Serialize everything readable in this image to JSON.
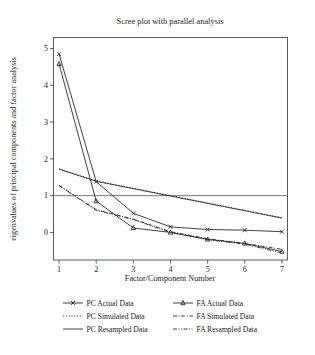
{
  "figure": {
    "title": "Scree plot with parallel analysis",
    "background_color": "#ffffff",
    "line_color": "#2b2b2b",
    "frame_color": "#333333",
    "reference_line_color": "#555555"
  },
  "axes": {
    "x_label": "Factor/Component Number",
    "y_label": "eigenvalues of principal components and factor analysis",
    "x_ticks": [
      "1",
      "2",
      "3",
      "4",
      "5",
      "6",
      "7"
    ],
    "y_ticks": [
      "0",
      "1",
      "2",
      "3",
      "4",
      "5"
    ]
  },
  "legend": {
    "entries": [
      {
        "label": "PC Actual Data",
        "style": "solid-marker-x",
        "column": 0,
        "row": 0
      },
      {
        "label": "PC Simulated Data",
        "style": "dotted",
        "column": 0,
        "row": 1
      },
      {
        "label": "PC Resampled Data",
        "style": "solid",
        "column": 0,
        "row": 2
      },
      {
        "label": "FA Actual Data",
        "style": "solid-marker-triangle",
        "column": 1,
        "row": 0
      },
      {
        "label": "FA Simulated Data",
        "style": "dash-dot",
        "column": 1,
        "row": 1
      },
      {
        "label": "FA Resampled Data",
        "style": "dash-dot-dot",
        "column": 1,
        "row": 2
      }
    ]
  },
  "chart_data": {
    "type": "line",
    "title": "Scree plot with parallel analysis",
    "xlabel": "Factor/Component Number",
    "ylabel": "eigenvalues of principal components and factor analysis",
    "x": [
      1,
      2,
      3,
      4,
      5,
      6,
      7
    ],
    "xlim": [
      0.85,
      7.15
    ],
    "ylim": [
      -0.75,
      5.3
    ],
    "grid": false,
    "legend_position": "below-plot",
    "reference_line_y": 1,
    "series": [
      {
        "name": "PC Actual Data",
        "marker": "x",
        "linestyle": "solid",
        "values": [
          4.85,
          1.38,
          0.52,
          0.15,
          0.08,
          0.06,
          0.02
        ]
      },
      {
        "name": "FA Actual Data",
        "marker": "triangle",
        "linestyle": "solid",
        "values": [
          4.58,
          0.85,
          0.12,
          0.0,
          -0.19,
          -0.3,
          -0.52
        ]
      },
      {
        "name": "PC Simulated Data",
        "marker": "none",
        "linestyle": "dotted",
        "values": [
          1.73,
          1.4,
          1.2,
          1.0,
          0.8,
          0.6,
          0.4
        ]
      },
      {
        "name": "PC Resampled Data",
        "marker": "none",
        "linestyle": "solid",
        "values": [
          1.72,
          1.39,
          1.19,
          0.99,
          0.79,
          0.59,
          0.39
        ]
      },
      {
        "name": "FA Simulated Data",
        "marker": "none",
        "linestyle": "dash-dot",
        "values": [
          1.28,
          0.62,
          0.36,
          0.02,
          -0.17,
          -0.3,
          -0.46
        ]
      },
      {
        "name": "FA Resampled Data",
        "marker": "none",
        "linestyle": "dash-dot-dot",
        "values": [
          1.27,
          0.6,
          0.35,
          0.0,
          -0.2,
          -0.32,
          -0.56
        ]
      }
    ]
  }
}
